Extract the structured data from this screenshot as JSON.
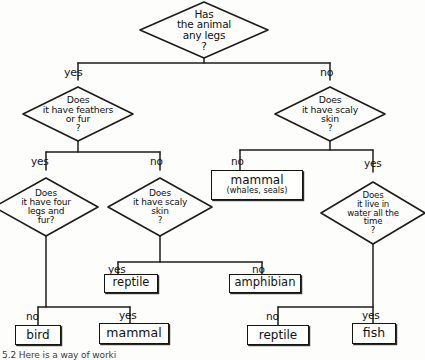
{
  "diagram": {
    "ink_color": "#15140f",
    "paper_color": "#fdfdfc",
    "caption": "5.2 Here is a way of worki"
  },
  "decisions": [
    {
      "id": "legs",
      "lines": [
        "Has",
        "the animal",
        "any legs",
        "?"
      ]
    },
    {
      "id": "feathers-fur",
      "lines": [
        "Does",
        "it have feathers",
        "or fur",
        "?"
      ]
    },
    {
      "id": "scaly-skin-right",
      "lines": [
        "Does",
        "it have scaly",
        "skin",
        "?"
      ]
    },
    {
      "id": "four-legs-fur",
      "lines": [
        "Does",
        "it have four",
        "legs and",
        "fur?"
      ]
    },
    {
      "id": "scaly-skin-left",
      "lines": [
        "Does",
        "it have scaly",
        "skin",
        "?"
      ]
    },
    {
      "id": "water-all-time",
      "lines": [
        "Does",
        "it live in",
        "water all the",
        "time",
        "?"
      ]
    }
  ],
  "terminals": [
    {
      "id": "mammal-aquatic",
      "main": "mammal",
      "sub": "(whales, seals)"
    },
    {
      "id": "reptile-left",
      "main": "reptile",
      "sub": ""
    },
    {
      "id": "amphibian",
      "main": "amphibian",
      "sub": ""
    },
    {
      "id": "bird",
      "main": "bird",
      "sub": ""
    },
    {
      "id": "mammal",
      "main": "mammal",
      "sub": ""
    },
    {
      "id": "reptile-right",
      "main": "reptile",
      "sub": ""
    },
    {
      "id": "fish",
      "main": "fish",
      "sub": ""
    }
  ],
  "edge_labels": {
    "legs_yes": "yes",
    "legs_no": "no",
    "feathers_yes": "yes",
    "feathers_no": "no",
    "scaly_right_no": "no",
    "scaly_right_yes": "yes",
    "scaly_left_yes": "yes",
    "water_no": "no",
    "water_yes": "yes",
    "fourlegs_no": "no",
    "fourlegs_yes": "yes"
  }
}
